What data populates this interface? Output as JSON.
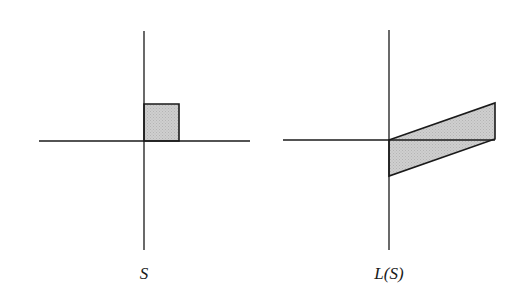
{
  "figure": {
    "panels": [
      {
        "id": "original",
        "caption": "S",
        "caption_x": 144,
        "axes": {
          "vertical": {
            "x": 144,
            "y1": 31,
            "y2": 250
          },
          "horizontal": {
            "y": 141,
            "x1": 39,
            "x2": 250
          }
        },
        "shape": {
          "kind": "square",
          "points": "144,104 179,104 179,141 144,141"
        }
      },
      {
        "id": "transformed",
        "caption": "L(S)",
        "caption_x": 389,
        "axes": {
          "vertical": {
            "x": 389,
            "y1": 30,
            "y2": 250
          },
          "horizontal": {
            "y": 140,
            "x1": 283,
            "x2": 495
          }
        },
        "shape": {
          "kind": "parallelogram",
          "points": "389,140 495,103 495,139 389,176"
        }
      }
    ],
    "colors": {
      "fill": "#c9c9c9",
      "stroke": "#1a1a1a",
      "background": "#ffffff"
    }
  }
}
